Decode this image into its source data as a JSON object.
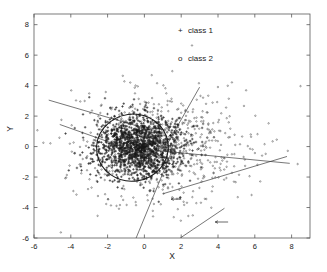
{
  "figure": {
    "background_color": "#ffffff",
    "foreground_color": "#1a1a1a"
  },
  "axes": {
    "x_title": "X",
    "y_title": "Y",
    "x_ticks": [
      "-6",
      "-4",
      "-2",
      "0",
      "2",
      "4",
      "6",
      "8"
    ],
    "y_ticks": [
      "8",
      "6",
      "4",
      "2",
      "0",
      "-2",
      "-4",
      "-6"
    ]
  },
  "legend": {
    "entries": [
      {
        "marker": "+",
        "label": "class 1"
      },
      {
        "marker": "o",
        "label": "class 2"
      }
    ]
  },
  "chart_data": {
    "type": "scatter",
    "title": "",
    "xlabel": "X",
    "ylabel": "Y",
    "xlim": [
      -6,
      9
    ],
    "ylim": [
      -6,
      8.7
    ],
    "xticks": [
      -6,
      -4,
      -2,
      0,
      2,
      4,
      6,
      8
    ],
    "yticks": [
      -6,
      -4,
      -2,
      0,
      2,
      4,
      6,
      8
    ],
    "grid": false,
    "legend_position": "inside-top-center",
    "series": [
      {
        "name": "class 1",
        "marker": "+",
        "color": "#1a1a1a",
        "n_points": 1400,
        "distribution": "gaussian",
        "mean": [
          -0.3,
          0.0
        ],
        "std": [
          1.15,
          1.0
        ],
        "note": "dense central cluster"
      },
      {
        "name": "class 2",
        "marker": "o",
        "color": "#3a3a3a",
        "n_points": 700,
        "distribution": "gaussian",
        "mean": [
          0.9,
          0.1
        ],
        "std": [
          2.4,
          1.9
        ],
        "note": "broad surrounding cloud"
      }
    ],
    "annotations": [
      {
        "type": "ellipse",
        "center": [
          -0.65,
          -0.07
        ],
        "rx": 1.95,
        "ry": 2.2,
        "rotation_deg": -8
      },
      {
        "type": "line",
        "p1": [
          -5.2,
          3.05
        ],
        "p2": [
          -0.1,
          1.25
        ]
      },
      {
        "type": "line",
        "p1": [
          -4.6,
          1.45
        ],
        "p2": [
          0.05,
          -0.55
        ]
      },
      {
        "type": "line",
        "p1": [
          1.0,
          -0.35
        ],
        "p2": [
          3.0,
          3.9
        ]
      },
      {
        "type": "line",
        "p1": [
          0.15,
          -0.2
        ],
        "p2": [
          7.9,
          -1.1
        ]
      },
      {
        "type": "line",
        "p1": [
          -0.45,
          -6.0
        ],
        "p2": [
          1.55,
          -0.15
        ]
      },
      {
        "type": "line",
        "p1": [
          1.0,
          -3.1
        ],
        "p2": [
          7.75,
          -0.65
        ]
      },
      {
        "type": "line",
        "p1": [
          1.95,
          -6.0
        ],
        "p2": [
          4.35,
          -4.05
        ]
      },
      {
        "type": "arrow",
        "tip": [
          3.85,
          -4.95
        ],
        "tail": [
          4.55,
          -4.95
        ],
        "direction": "left"
      },
      {
        "type": "arrow",
        "tip": [
          1.45,
          -3.45
        ],
        "tail": [
          2.0,
          -3.45
        ],
        "direction": "left"
      }
    ]
  }
}
